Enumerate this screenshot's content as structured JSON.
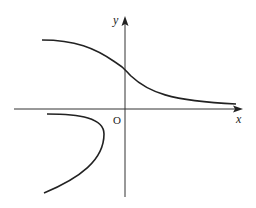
{
  "diagram": {
    "type": "function-graph",
    "axes": {
      "x_label": "x",
      "y_label": "y",
      "origin_label": "O"
    },
    "curves": [
      {
        "name": "upper-decreasing-curve",
        "description": "Decreasing curve from upper-left, crossing y-axis above origin, approaching x-axis asymptotically to the right"
      },
      {
        "name": "lower-left-c-shaped-curve",
        "description": "C-shaped curve in third quadrant opening to the left"
      }
    ],
    "colors": {
      "stroke": "#222222",
      "axis": "#333333",
      "background": "#ffffff"
    }
  }
}
